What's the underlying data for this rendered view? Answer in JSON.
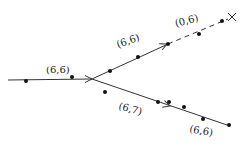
{
  "diagram": {
    "type": "branching-line-diagram",
    "stroke_color": "#333333",
    "dot_color": "#111111",
    "segments": [
      {
        "id": "incoming",
        "x1": 8,
        "y1": 80,
        "x2": 92,
        "y2": 79,
        "style": "solid"
      },
      {
        "id": "upper-solid",
        "x1": 92,
        "y1": 79,
        "x2": 168,
        "y2": 44,
        "style": "solid"
      },
      {
        "id": "upper-dashed",
        "x1": 168,
        "y1": 44,
        "x2": 228,
        "y2": 19,
        "style": "dashed"
      },
      {
        "id": "lower",
        "x1": 92,
        "y1": 79,
        "x2": 230,
        "y2": 126,
        "style": "solid"
      }
    ],
    "arrows": [
      {
        "id": "arrow-incoming",
        "x": 92,
        "y": 79,
        "angle": 0
      },
      {
        "id": "arrow-upper",
        "x": 167,
        "y": 44,
        "angle": -24
      },
      {
        "id": "arrow-lower",
        "x": 170,
        "y": 106,
        "angle": 18
      }
    ],
    "end_marks": [
      {
        "id": "cross-end",
        "x": 232,
        "y": 17
      }
    ],
    "dots": [
      {
        "x": 26,
        "y": 81
      },
      {
        "x": 72,
        "y": 77
      },
      {
        "x": 110,
        "y": 71
      },
      {
        "x": 138,
        "y": 57
      },
      {
        "x": 168,
        "y": 44
      },
      {
        "x": 199,
        "y": 34
      },
      {
        "x": 222,
        "y": 21
      },
      {
        "x": 105,
        "y": 92
      },
      {
        "x": 158,
        "y": 102
      },
      {
        "x": 169,
        "y": 102
      },
      {
        "x": 184,
        "y": 107
      },
      {
        "x": 203,
        "y": 119
      },
      {
        "x": 229,
        "y": 125
      }
    ],
    "labels": [
      {
        "id": "label-incoming",
        "text": "(6,6)",
        "x": 46,
        "y": 73,
        "rotate": 0
      },
      {
        "id": "label-upper",
        "text": "(6,6)",
        "x": 118,
        "y": 48,
        "rotate": -20
      },
      {
        "id": "label-dashed",
        "text": "(0,6)",
        "x": 176,
        "y": 27,
        "rotate": -15
      },
      {
        "id": "label-lower-mid",
        "text": "(6,7)",
        "x": 118,
        "y": 109,
        "rotate": 15
      },
      {
        "id": "label-lower-end",
        "text": "(6,6)",
        "x": 189,
        "y": 132,
        "rotate": 10
      }
    ]
  }
}
